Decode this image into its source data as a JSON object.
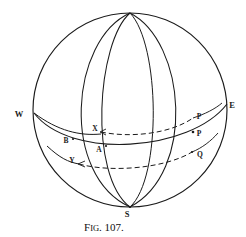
{
  "figure": {
    "caption_prefix": "F",
    "caption_small": "IG",
    "caption_number": ". 107.",
    "caption_full": "Fig. 107.",
    "background_color": "#ffffff",
    "ink_color": "#1b1b1b"
  },
  "geometry": {
    "sphere": {
      "center_x": 130,
      "center_y": 110,
      "radius": 97,
      "top_pole_x": 130,
      "top_pole_y": 13,
      "bottom_pole_x": 130,
      "bottom_pole_y": 207
    },
    "horizon": {
      "left_x": 34,
      "left_y": 113,
      "right_x": 227,
      "right_y": 104,
      "sag": 34
    }
  },
  "labels": [
    {
      "id": "W",
      "text": "W",
      "x": 19,
      "y": 117,
      "note": "west cardinal point at left of horizon"
    },
    {
      "id": "E",
      "text": "E",
      "x": 232,
      "y": 108,
      "note": "east cardinal point at right of horizon"
    },
    {
      "id": "S",
      "text": "S",
      "x": 127,
      "y": 216,
      "note": "south pole at bottom of sphere"
    },
    {
      "id": "B",
      "text": "B",
      "x": 66,
      "y": 143,
      "note": "point on horizon on left meridian"
    },
    {
      "id": "X",
      "text": "X",
      "x": 95,
      "y": 131,
      "note": "start of upper dashed arc"
    },
    {
      "id": "A",
      "text": "A",
      "x": 99,
      "y": 151,
      "note": "point on horizon on middle meridian"
    },
    {
      "id": "Y",
      "text": "Y",
      "x": 72,
      "y": 162,
      "note": "start of lower dashed arc"
    },
    {
      "id": "P",
      "text": "P",
      "x": 195,
      "y": 119,
      "note": "upper right intersection point"
    },
    {
      "id": "P2",
      "text": "P",
      "x": 195,
      "y": 137,
      "note": "second P on horizon, right side"
    },
    {
      "id": "Q",
      "text": "Q",
      "x": 196,
      "y": 156,
      "note": "lower right intersection point"
    }
  ],
  "arcs": {
    "dashed_upper": {
      "from": "X",
      "to": "P"
    },
    "dashed_lower": {
      "from": "Y",
      "to": "Q"
    },
    "meridian_count": 4
  }
}
